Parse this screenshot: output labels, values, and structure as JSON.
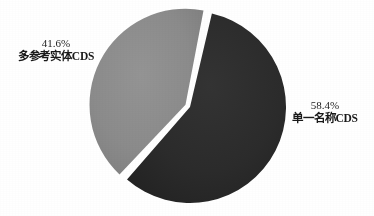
{
  "chart_data": {
    "type": "pie",
    "title": "",
    "subtitle": "",
    "xlabel": "",
    "ylabel": "",
    "legend_position": "none",
    "grid": false,
    "labels_inside": false,
    "categories": [
      "单一名称CDS",
      "多参考实体CDS"
    ],
    "values": [
      58.4,
      41.6
    ],
    "unit": "%",
    "slices": [
      {
        "name": "单一名称CDS",
        "percent_text": "58.4%",
        "value": 58.4,
        "color": "#2b2b2b",
        "exploded": false,
        "label_position": "right"
      },
      {
        "name": "多参考实体CDS",
        "percent_text": "41.6%",
        "value": 41.6,
        "color": "#8a8a8a",
        "exploded": true,
        "label_position": "left"
      }
    ]
  },
  "labels": {
    "multi_reference": {
      "percent": "41.6%",
      "name": "多参考实体CDS"
    },
    "single_name": {
      "percent": "58.4%",
      "name": "单一名称CDS"
    }
  },
  "colors": {
    "background": "#ffffff",
    "slice_dark": "#2b2b2b",
    "slice_gray": "#8a8a8a",
    "separator": "#ffffff",
    "text": "#191919"
  },
  "geometry": {
    "center_x": 190,
    "center_y": 107,
    "radius": 96,
    "start_angle_deg": 12,
    "explode_offset_px": 5
  }
}
